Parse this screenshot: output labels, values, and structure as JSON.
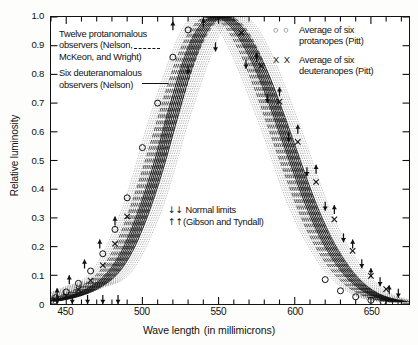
{
  "chart_data": {
    "type": "line",
    "title": "",
    "xlabel": "Wave length (in millimicrons)",
    "ylabel": "Relative luminosity",
    "xlim": [
      440,
      675
    ],
    "ylim": [
      0,
      1.0
    ],
    "grid": false,
    "xticks": [
      450,
      500,
      550,
      600,
      650
    ],
    "xtick_labels": [
      "450",
      "500",
      "550",
      "600",
      "650"
    ],
    "xminor_step": 10,
    "yticks": [
      0,
      0.1,
      0.2,
      0.3,
      0.4,
      0.5,
      0.6,
      0.7,
      0.8,
      0.9,
      1.0
    ],
    "ytick_labels": [
      "0",
      "0.1",
      "0.2",
      "0.3",
      "0.4",
      "0.5",
      "0.6",
      "0.7",
      "0.8",
      "0.9",
      "1.0"
    ],
    "legend_position": "inside-top-left and inside-top-right",
    "series": [
      {
        "name": "Twelve protanomalous observers (Nelson, McKeon, and Wright)",
        "style": "dashed",
        "x": [
          440,
          450,
          460,
          470,
          480,
          490,
          500,
          510,
          520,
          530,
          540,
          550,
          560,
          570,
          580,
          590,
          600,
          610,
          620,
          630,
          640,
          650,
          660,
          670
        ],
        "values": [
          0.012,
          0.025,
          0.045,
          0.075,
          0.125,
          0.22,
          0.36,
          0.53,
          0.71,
          0.87,
          0.97,
          1.0,
          0.97,
          0.88,
          0.75,
          0.6,
          0.45,
          0.31,
          0.2,
          0.12,
          0.065,
          0.032,
          0.015,
          0.006
        ]
      },
      {
        "name": "Six deuteranomalous observers (Nelson)",
        "style": "solid",
        "x": [
          440,
          450,
          460,
          470,
          480,
          490,
          500,
          510,
          520,
          530,
          540,
          550,
          560,
          570,
          580,
          590,
          600,
          610,
          620,
          630,
          640,
          650,
          660,
          670
        ],
        "values": [
          0.01,
          0.02,
          0.036,
          0.062,
          0.105,
          0.185,
          0.31,
          0.47,
          0.66,
          0.84,
          0.96,
          1.0,
          0.975,
          0.9,
          0.79,
          0.65,
          0.5,
          0.355,
          0.235,
          0.145,
          0.08,
          0.04,
          0.019,
          0.008
        ]
      },
      {
        "name": "Average of six protanopes (Pitt)",
        "style": "circle-markers",
        "x": [
          443,
          450,
          458,
          466,
          474,
          482,
          490,
          500,
          510,
          520,
          530,
          620,
          630,
          640,
          650,
          658,
          666
        ],
        "values": [
          0.022,
          0.042,
          0.072,
          0.115,
          0.175,
          0.26,
          0.37,
          0.545,
          0.7,
          0.86,
          0.955,
          0.085,
          0.046,
          0.025,
          0.013,
          0.008,
          0.004
        ]
      },
      {
        "name": "Average of six deuteranopes (Pitt)",
        "style": "x-markers",
        "x": [
          443,
          450,
          458,
          466,
          474,
          482,
          490,
          565,
          578,
          590,
          602,
          614,
          626,
          638,
          650,
          660
        ],
        "values": [
          0.014,
          0.028,
          0.05,
          0.082,
          0.135,
          0.21,
          0.305,
          0.945,
          0.83,
          0.705,
          0.565,
          0.425,
          0.295,
          0.185,
          0.098,
          0.052
        ]
      },
      {
        "name": "Normal limits upper (Gibson and Tyndall)",
        "style": "down-arrow-markers",
        "x": [
          444,
          452,
          462,
          472,
          482,
          520,
          540,
          575,
          590,
          602,
          614,
          626,
          638,
          650,
          662
        ],
        "values": [
          0.055,
          0.1,
          0.155,
          0.225,
          0.305,
          0.985,
          0.995,
          0.875,
          0.755,
          0.625,
          0.485,
          0.345,
          0.225,
          0.125,
          0.065
        ]
      },
      {
        "name": "Normal limits lower (Gibson and Tyndall)",
        "style": "up-arrow-markers",
        "x": [
          444,
          454,
          464,
          474,
          484,
          530,
          548,
          568,
          582,
          596,
          608,
          620,
          632,
          644,
          656,
          668
        ],
        "values": [
          0.0,
          0.0,
          0.0,
          0.0,
          0.0,
          0.8,
          0.88,
          0.82,
          0.7,
          0.565,
          0.445,
          0.325,
          0.215,
          0.125,
          0.062,
          0.022
        ]
      },
      {
        "name": "Individual observer curves band (stippled)",
        "style": "stipple-band",
        "x": [
          440,
          460,
          480,
          500,
          520,
          540,
          555,
          570,
          590,
          610,
          630,
          650,
          670
        ],
        "values": [
          0.018,
          0.055,
          0.115,
          0.335,
          0.685,
          0.965,
          1.0,
          0.89,
          0.625,
          0.33,
          0.135,
          0.036,
          0.007
        ]
      }
    ],
    "annotations": [
      {
        "text": "Normal limits",
        "marks": "down-arrows"
      },
      {
        "text": "(Gibson and Tyndall)",
        "marks": "up-arrows"
      }
    ]
  },
  "axes": {
    "y_label": "Relative luminosity",
    "x_label_main": "Wave length",
    "x_label_paren": "(in millimicrons)",
    "y_tick_labels": [
      "1.0",
      "0.9",
      "0.8",
      "0.7",
      "0.6",
      "0.5",
      "0.4",
      "0.3",
      "0.2",
      "0.1",
      "0"
    ],
    "x_tick_labels": [
      "450",
      "500",
      "550",
      "600",
      "650"
    ]
  },
  "legend_left": {
    "entry1_line1": "Twelve protanomalous",
    "entry1_line2": "observers (Nelson,",
    "entry1_line3": "McKeon, and Wright)",
    "entry1_style": "dashed",
    "entry2_line1": "Six deuteranomalous",
    "entry2_line2": "observers (Nelson)",
    "entry2_style": "solid"
  },
  "legend_right": {
    "entry1_marks": "○ ○",
    "entry1_line1": "Average of six",
    "entry1_line2": "protanopes (Pitt)",
    "entry2_marks": "X X",
    "entry2_line1": "Average of six",
    "entry2_line2": "deuteranopes (Pitt)"
  },
  "annotation_normal_limits": {
    "line1_marks": "↓↓",
    "line1_text": "Normal limits",
    "line2_marks": "↑↑",
    "line2_text": "(Gibson and Tyndall)"
  },
  "colors": {
    "ink": "#111111",
    "paper": "#ffffff",
    "page": "#fdfdfb"
  }
}
